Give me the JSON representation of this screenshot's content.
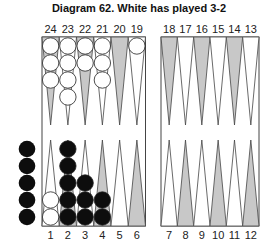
{
  "title": "Diagram 62.  White has played 3-2",
  "colors": {
    "gray_point": "#c8c8c8",
    "white_point": "#ffffff",
    "outline": "#444444",
    "white_checker": "#ffffff",
    "black_checker": "#0d0d0d"
  },
  "top_points": [
    {
      "label": "24",
      "color": "gray",
      "checkers": {
        "color": "white",
        "count": 3
      }
    },
    {
      "label": "23",
      "color": "white",
      "checkers": {
        "color": "white",
        "count": 4
      }
    },
    {
      "label": "22",
      "color": "gray",
      "checkers": {
        "color": "white",
        "count": 2
      }
    },
    {
      "label": "21",
      "color": "white",
      "checkers": {
        "color": "white",
        "count": 3
      }
    },
    {
      "label": "20",
      "color": "gray",
      "checkers": {
        "color": "",
        "count": 0
      }
    },
    {
      "label": "19",
      "color": "white",
      "checkers": {
        "color": "white",
        "count": 1
      }
    },
    {
      "label": "18",
      "color": "gray",
      "checkers": {
        "color": "",
        "count": 0
      }
    },
    {
      "label": "17",
      "color": "white",
      "checkers": {
        "color": "",
        "count": 0
      }
    },
    {
      "label": "16",
      "color": "gray",
      "checkers": {
        "color": "",
        "count": 0
      }
    },
    {
      "label": "15",
      "color": "white",
      "checkers": {
        "color": "",
        "count": 0
      }
    },
    {
      "label": "14",
      "color": "gray",
      "checkers": {
        "color": "",
        "count": 0
      }
    },
    {
      "label": "13",
      "color": "white",
      "checkers": {
        "color": "",
        "count": 0
      }
    }
  ],
  "bottom_points": [
    {
      "label": "1",
      "color": "white",
      "checkers": {
        "color": "white",
        "count": 2
      }
    },
    {
      "label": "2",
      "color": "gray",
      "checkers": {
        "color": "black",
        "count": 5
      }
    },
    {
      "label": "3",
      "color": "white",
      "checkers": {
        "color": "black",
        "count": 3
      }
    },
    {
      "label": "4",
      "color": "gray",
      "checkers": {
        "color": "black",
        "count": 2
      }
    },
    {
      "label": "5",
      "color": "white",
      "checkers": {
        "color": "",
        "count": 0
      }
    },
    {
      "label": "6",
      "color": "gray",
      "checkers": {
        "color": "",
        "count": 0
      }
    },
    {
      "label": "7",
      "color": "white",
      "checkers": {
        "color": "",
        "count": 0
      }
    },
    {
      "label": "8",
      "color": "gray",
      "checkers": {
        "color": "",
        "count": 0
      }
    },
    {
      "label": "9",
      "color": "white",
      "checkers": {
        "color": "",
        "count": 0
      }
    },
    {
      "label": "10",
      "color": "gray",
      "checkers": {
        "color": "",
        "count": 0
      }
    },
    {
      "label": "11",
      "color": "white",
      "checkers": {
        "color": "",
        "count": 0
      }
    },
    {
      "label": "12",
      "color": "gray",
      "checkers": {
        "color": "",
        "count": 0
      }
    }
  ],
  "borne_off": {
    "color": "black",
    "count": 5
  }
}
